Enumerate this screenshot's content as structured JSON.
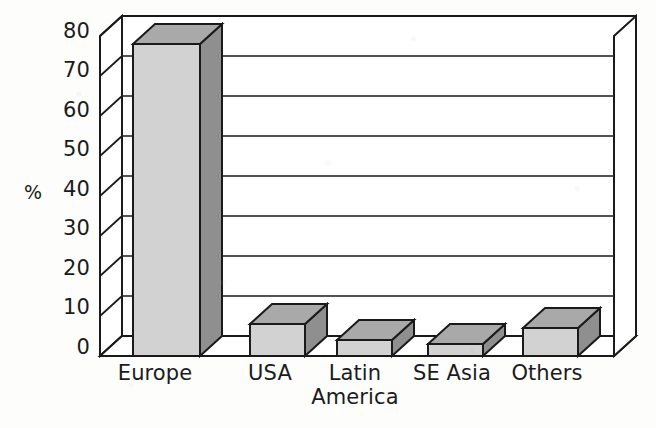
{
  "chart_data": {
    "type": "bar",
    "title": "",
    "subtitle": "",
    "xlabel": "",
    "ylabel": "%",
    "categories": [
      "Europe",
      "USA",
      "Latin America",
      "SE Asia",
      "Others"
    ],
    "values": [
      78,
      8,
      4,
      3,
      7
    ],
    "ylim": [
      0,
      80
    ],
    "y_ticks": [
      0,
      10,
      20,
      30,
      40,
      50,
      60,
      70,
      80
    ],
    "y_tick_labels": [
      "0",
      "10",
      "20",
      "30",
      "40",
      "50",
      "60",
      "70",
      "80"
    ],
    "grid": true,
    "grid_orientation": "horizontal",
    "legend": false,
    "legend_position": "none",
    "style": "3d-bar",
    "annotations": []
  },
  "axes": {
    "y_axis_title": "%",
    "y_tick_labels": [
      "80",
      "70",
      "60",
      "50",
      "40",
      "30",
      "20",
      "10",
      "0"
    ]
  },
  "bars": [
    {
      "label": "Europe",
      "value": 78,
      "display_label": "Europe"
    },
    {
      "label": "USA",
      "value": 8,
      "display_label": "USA"
    },
    {
      "label": "Latin America",
      "value": 4,
      "display_label": "Latin\nAmerica"
    },
    {
      "label": "SE Asia",
      "value": 3,
      "display_label": "SE Asia"
    },
    {
      "label": "Others",
      "value": 7,
      "display_label": "Others"
    }
  ],
  "colors": {
    "bar_front": "#d2d2d2",
    "bar_top": "#a9a9a9",
    "bar_side": "#8f8f8f",
    "outline": "#1a1a1a",
    "grid_line": "#1a1a1a",
    "background": "#fdfdfc",
    "text": "#1b1b1b"
  }
}
